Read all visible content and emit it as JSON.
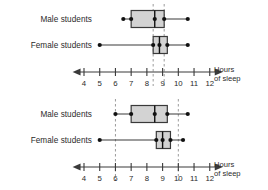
{
  "figure": {
    "type": "boxplot-pair",
    "background": "#ffffff",
    "box_fill": "#d3d3d3",
    "line_color": "#3a3a3a",
    "dash_color": "#9b9b9b"
  },
  "axis": {
    "caption_line1": "Hours",
    "caption_line2": "of sleep",
    "ticks": [
      4,
      5,
      6,
      7,
      8,
      9,
      10,
      11,
      12
    ],
    "tick_labels": [
      "4",
      "5",
      "6",
      "7",
      "8",
      "9",
      "10",
      "11",
      "12"
    ],
    "min": 3.4,
    "max": 12.7,
    "arrow_left": true,
    "arrow_right": true
  },
  "charts": [
    {
      "id": "chart-top",
      "series": [
        {
          "label": "Male students",
          "min": 6.5,
          "q1": 7.0,
          "median": 8.5,
          "q3": 9.1,
          "max": 10.6
        },
        {
          "label": "Female students",
          "min": 5.0,
          "q1": 8.4,
          "median": 8.8,
          "q3": 9.3,
          "max": 10.6
        }
      ],
      "dashed_lines": [
        8.4,
        9.1
      ]
    },
    {
      "id": "chart-bottom",
      "series": [
        {
          "label": "Male students",
          "min": 6.0,
          "q1": 7.0,
          "median": 8.5,
          "q3": 9.3,
          "max": 10.6
        },
        {
          "label": "Female students",
          "min": 5.0,
          "q1": 8.6,
          "median": 9.0,
          "q3": 9.5,
          "max": 10.3
        }
      ],
      "dashed_lines": [
        6.0,
        10.0
      ]
    }
  ],
  "chart_data": {
    "type": "box",
    "title": "",
    "xlabel": "Hours of sleep",
    "ylabel": "",
    "xlim": [
      3.4,
      12.7
    ],
    "xticks": [
      4,
      5,
      6,
      7,
      8,
      9,
      10,
      11,
      12
    ],
    "grid": false,
    "legend": "none",
    "panels": [
      {
        "name": "Top box plot",
        "dashed_reference_lines": [
          8.4,
          9.1
        ],
        "boxes": [
          {
            "category": "Male students",
            "min": 6.5,
            "q1": 7.0,
            "median": 8.5,
            "q3": 9.1,
            "max": 10.6
          },
          {
            "category": "Female students",
            "min": 5.0,
            "q1": 8.4,
            "median": 8.8,
            "q3": 9.3,
            "max": 10.6
          }
        ]
      },
      {
        "name": "Bottom box plot",
        "dashed_reference_lines": [
          6.0,
          10.0
        ],
        "boxes": [
          {
            "category": "Male students",
            "min": 6.0,
            "q1": 7.0,
            "median": 8.5,
            "q3": 9.3,
            "max": 10.6
          },
          {
            "category": "Female students",
            "min": 5.0,
            "q1": 8.6,
            "median": 9.0,
            "q3": 9.5,
            "max": 10.3
          }
        ]
      }
    ]
  }
}
